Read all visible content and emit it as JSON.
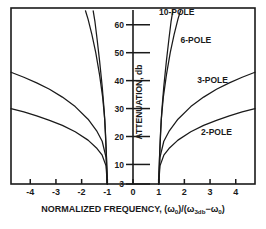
{
  "chart_data": {
    "type": "line",
    "title": "",
    "xlabel": "NORMALIZED FREQUENCY, (ω-ω₀)/(ω₃ₔₕ-ω₀)",
    "xlabel_parts": {
      "main": "NORMALIZED FREQUENCY, (",
      "w1": "ω",
      "sub1": "0",
      "mid": ")/(",
      "w2": "ω",
      "sub2": "3db",
      "minus": "−",
      "w3": "ω",
      "sub3": "0",
      "end": ")"
    },
    "ylabel": "ATTENUATION, db",
    "xlim": [
      -4.75,
      4.75
    ],
    "ylim": [
      3,
      66
    ],
    "grid": false,
    "legend_position": "inline-annotations",
    "xticks": [
      -4,
      -3,
      -2,
      -1,
      0,
      1,
      2,
      3,
      4
    ],
    "xticklabels": [
      "-4",
      "-3",
      "-2",
      "-1",
      "0",
      "1",
      "2",
      "3",
      "4"
    ],
    "yticks": [
      3,
      10,
      20,
      30,
      40,
      50,
      60
    ],
    "yticklabels": [
      "3",
      "10",
      "20",
      "30",
      "40",
      "50",
      "60"
    ],
    "series": [
      {
        "name": "2-POLE",
        "label": "2-POLE",
        "x": [
          -4.75,
          -4.25,
          -3.75,
          -3.25,
          -2.75,
          -2.25,
          -1.75,
          -1.4,
          -1.2,
          -1.05,
          -1.0,
          1.0,
          1.05,
          1.2,
          1.4,
          1.75,
          2.25,
          2.75,
          3.25,
          3.75,
          4.25,
          4.75
        ],
        "y": [
          30.0,
          28.8,
          27.4,
          25.8,
          24.0,
          21.7,
          18.7,
          15.7,
          13.3,
          9.5,
          3.0,
          3.0,
          9.5,
          13.3,
          15.7,
          18.7,
          21.7,
          24.0,
          25.8,
          27.4,
          28.8,
          30.0
        ]
      },
      {
        "name": "3-POLE",
        "label": "3-POLE",
        "x": [
          -4.75,
          -4.25,
          -3.75,
          -3.25,
          -2.75,
          -2.25,
          -1.75,
          -1.4,
          -1.2,
          -1.05,
          -1.0,
          1.0,
          1.05,
          1.2,
          1.4,
          1.75,
          2.25,
          2.75,
          3.25,
          3.75,
          4.25,
          4.75
        ],
        "y": [
          43.0,
          41.2,
          39.2,
          36.9,
          34.1,
          30.7,
          26.2,
          21.8,
          18.3,
          12.5,
          3.0,
          3.0,
          12.5,
          18.3,
          21.8,
          26.2,
          30.7,
          34.1,
          36.9,
          39.2,
          41.2,
          43.0
        ]
      },
      {
        "name": "6-POLE",
        "label": "6-POLE",
        "x": [
          -1.85,
          -1.75,
          -1.6,
          -1.45,
          -1.3,
          -1.18,
          -1.1,
          -1.04,
          -1.0,
          1.0,
          1.04,
          1.1,
          1.18,
          1.3,
          1.45,
          1.6,
          1.75,
          1.85
        ],
        "y": [
          65.0,
          62.0,
          56.5,
          50.0,
          42.0,
          34.0,
          26.0,
          14.0,
          3.0,
          3.0,
          14.0,
          26.0,
          34.0,
          42.0,
          50.0,
          56.5,
          62.0,
          65.0
        ]
      },
      {
        "name": "10-POLE",
        "label": "10-POLE",
        "x": [
          -1.55,
          -1.48,
          -1.4,
          -1.3,
          -1.2,
          -1.12,
          -1.07,
          -1.03,
          -1.0,
          1.0,
          1.03,
          1.07,
          1.12,
          1.2,
          1.3,
          1.4,
          1.48,
          1.55
        ],
        "y": [
          65.0,
          61.0,
          55.0,
          47.0,
          38.0,
          29.0,
          21.0,
          12.0,
          3.0,
          3.0,
          12.0,
          21.0,
          29.0,
          38.0,
          47.0,
          55.0,
          61.0,
          65.0
        ]
      }
    ],
    "annotations": [
      {
        "text": "10-POLE",
        "x": 1.7,
        "y": 63.5,
        "name": "curve-label-10-pole"
      },
      {
        "text": "6-POLE",
        "x": 2.45,
        "y": 53.5,
        "name": "curve-label-6-pole"
      },
      {
        "text": "3-POLE",
        "x": 3.1,
        "y": 39.0,
        "name": "curve-label-3-pole"
      },
      {
        "text": "2-POLE",
        "x": 3.25,
        "y": 20.5,
        "name": "curve-label-2-pole"
      }
    ],
    "colors": {
      "line": "#1a1a1a",
      "frame": "#1a1a1a",
      "background": "#ffffff"
    }
  }
}
